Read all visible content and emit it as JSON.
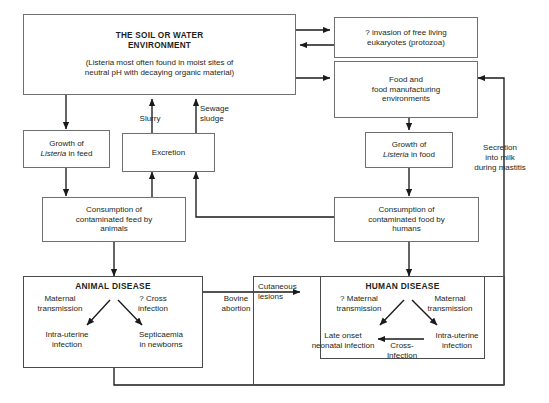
{
  "diagram": {
    "nodes": {
      "soil_water": {
        "title": "THE SOIL OR WATER\nENVIRONMENT",
        "subtitle": "(Listeria most often found in moist sites of\nneutral pH with decaying organic material)"
      },
      "protozoa": {
        "text": "? invasion of free living\neukaryotes (protozoa)"
      },
      "food_env": {
        "text": "Food and\nfood manufacturing\nenvironments"
      },
      "growth_feed": {
        "line1": "Growth of",
        "line2_italic": "Listeria",
        "line2_rest": " in feed"
      },
      "excretion": {
        "text": "Excretion"
      },
      "growth_food": {
        "line1": "Growth of",
        "line2_italic": "Listeria",
        "line2_rest": " in food"
      },
      "consumption_feed": {
        "text": "Consumption of\ncontaminated feed by\nanimals"
      },
      "consumption_food": {
        "text": "Consumption of\ncontaminated food by\nhumans"
      },
      "animal_disease": {
        "header": "ANIMAL DISEASE",
        "maternal_transmission": "Maternal\ntransmission",
        "cross_infection": "? Cross\ninfection",
        "intra_uterine": "Intra-uterine\ninfection",
        "septicaemia": "Septicaemia\nin newborns"
      },
      "human_disease": {
        "header": "HUMAN DISEASE",
        "cutaneous_lesions": "Cutaneous\nlesions",
        "maternal_transmission_q": "? Maternal\ntransmission",
        "maternal_transmission": "Maternal\ntransmission",
        "late_onset": "Late onset\nneonatal infection",
        "cross_infection": "Cross-\nInfection",
        "intra_uterine": "Intra-uterine\ninfection"
      }
    },
    "edge_labels": {
      "slurry": "Slurry",
      "sewage_sludge": "Sewage\nsludge",
      "bovine_abortion": "Bovine\nabortion",
      "secretion_milk": "Secretion\ninto milk\nduring mastitis"
    },
    "colors": {
      "line": "#4a4a4b",
      "box_border": "#6f6f70",
      "text": "#231f20",
      "background": "#ffffff"
    }
  }
}
